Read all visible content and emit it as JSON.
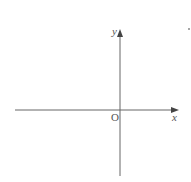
{
  "diagram": {
    "type": "cartesian-axes",
    "axes": {
      "x_label": "x",
      "y_label": "y",
      "origin_label": "O"
    },
    "colors": {
      "axis": "#555555",
      "background": "#ffffff"
    }
  }
}
